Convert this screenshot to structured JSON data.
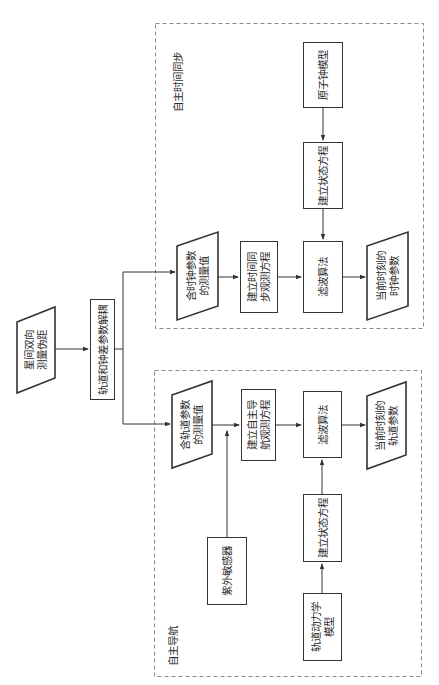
{
  "orientation": "rotated -90deg (reads bottom-to-top)",
  "colors": {
    "stroke": "#333333",
    "dashed_border": "#8a8a8a",
    "background": "#ffffff"
  },
  "source": {
    "label": "星间双向\n测量伪距",
    "shape": "parallelogram"
  },
  "decouple": {
    "label": "轨道和钟差参数解耦",
    "shape": "rectangle"
  },
  "groups": {
    "time_sync": {
      "title": "自主时间同步",
      "nodes": {
        "measurement": {
          "label": "含时钟参数\n的测量值",
          "shape": "parallelogram"
        },
        "observation_eq": {
          "label": "建立时间同\n步观测方程",
          "shape": "rectangle"
        },
        "filter": {
          "label": "滤波算法",
          "shape": "rectangle"
        },
        "output": {
          "label": "当前时刻的\n时钟参数",
          "shape": "parallelogram"
        },
        "state_eq": {
          "label": "建立状态方程",
          "shape": "rectangle"
        },
        "model": {
          "label": "原子钟模型",
          "shape": "rectangle"
        }
      }
    },
    "navigation": {
      "title": "自主导航",
      "nodes": {
        "measurement": {
          "label": "含轨道参数\n的测量值",
          "shape": "parallelogram"
        },
        "observation_eq": {
          "label": "建立自主导\n航观测方程",
          "shape": "rectangle"
        },
        "filter": {
          "label": "滤波算法",
          "shape": "rectangle"
        },
        "output": {
          "label": "当前时刻的\n轨道参数",
          "shape": "parallelogram"
        },
        "sensor": {
          "label": "紫外敏感器",
          "shape": "rectangle"
        },
        "state_eq": {
          "label": "建立状态方程",
          "shape": "rectangle"
        },
        "model": {
          "label": "轨道动力学\n模型",
          "shape": "rectangle"
        }
      }
    }
  },
  "edges": [
    [
      "source",
      "decouple"
    ],
    [
      "decouple",
      "time_sync.measurement"
    ],
    [
      "decouple",
      "navigation.measurement"
    ],
    [
      "time_sync.measurement",
      "time_sync.observation_eq"
    ],
    [
      "time_sync.observation_eq",
      "time_sync.filter"
    ],
    [
      "time_sync.model",
      "time_sync.state_eq"
    ],
    [
      "time_sync.state_eq",
      "time_sync.filter"
    ],
    [
      "time_sync.filter",
      "time_sync.output"
    ],
    [
      "navigation.measurement",
      "navigation.observation_eq"
    ],
    [
      "navigation.sensor",
      "navigation.observation_eq"
    ],
    [
      "navigation.observation_eq",
      "navigation.filter"
    ],
    [
      "navigation.model",
      "navigation.state_eq"
    ],
    [
      "navigation.state_eq",
      "navigation.filter"
    ],
    [
      "navigation.filter",
      "navigation.output"
    ]
  ]
}
